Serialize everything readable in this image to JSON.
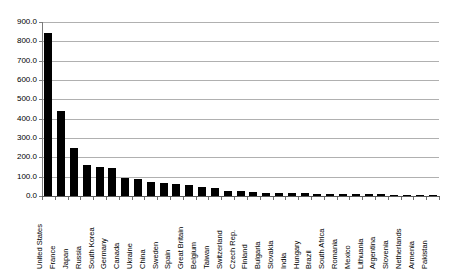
{
  "chart_data": {
    "type": "bar",
    "title": "",
    "subtitle": "",
    "xlabel": "",
    "ylabel": "",
    "ylim": [
      0,
      900
    ],
    "ytick_step": 100,
    "ytick_labels": [
      "0.0",
      "100.0",
      "200.0",
      "300.0",
      "400.0",
      "500.0",
      "600.0",
      "700.0",
      "800.0",
      "900.0"
    ],
    "grid": true,
    "legend": false,
    "legend_position": "none",
    "bar_color": "#000000",
    "gridline_color": "#b0b0b0",
    "axis_color": "#7a7a7a",
    "categories": [
      "United States",
      "France",
      "Japan",
      "Russia",
      "South Korea",
      "Germany",
      "Canada",
      "Ukraine",
      "China",
      "Sweden",
      "Spain",
      "Great Britain",
      "Belgium",
      "Taiwan",
      "Switzerland",
      "Czech Rep.",
      "Finland",
      "Bulgaria",
      "Slovakia",
      "India",
      "Hungary",
      "Brazil",
      "South Africa",
      "Romania",
      "Mexico",
      "Lithuania",
      "Argentina",
      "Slovenia",
      "Netherlands",
      "Armenia",
      "Pakistan"
    ],
    "values": [
      845.0,
      440.0,
      248.0,
      160.0,
      150.0,
      145.0,
      95.0,
      89.0,
      70.0,
      65.0,
      60.0,
      58.0,
      47.0,
      40.0,
      26.0,
      25.0,
      22.0,
      18.0,
      17.0,
      17.0,
      14.0,
      13.0,
      12.0,
      11.0,
      10.0,
      9.0,
      8.0,
      6.0,
      4.0,
      3.0,
      2.0
    ]
  }
}
